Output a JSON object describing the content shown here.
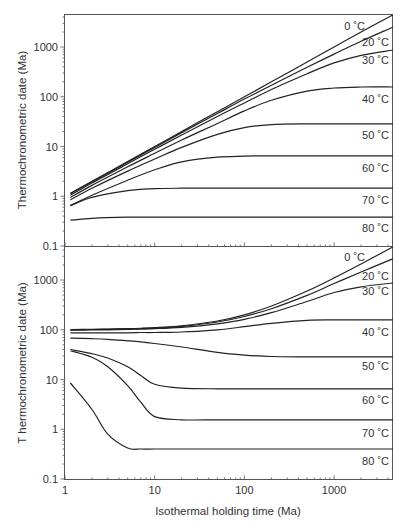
{
  "chart_data": [
    {
      "type": "line",
      "panel": "top",
      "title": "",
      "xlabel": "",
      "ylabel": "Thermochronometric date (Ma)",
      "xscale": "log",
      "yscale": "log",
      "xlim": [
        1,
        4500
      ],
      "ylim": [
        0.1,
        4600
      ],
      "yticks": [
        0.1,
        1,
        10,
        100,
        1000
      ],
      "ytick_labels": [
        "0.1",
        "1",
        "10",
        "100",
        "1000"
      ],
      "grid": false,
      "x": [
        1.15,
        2,
        5,
        10,
        20,
        50,
        100,
        200,
        500,
        1000,
        2000,
        4500
      ],
      "series": [
        {
          "name": "0 ˚C",
          "values": [
            1.15,
            2.0,
            5.0,
            10.0,
            20.0,
            50.0,
            100.0,
            200.0,
            500.0,
            1000.0,
            2000.0,
            4400.0
          ]
        },
        {
          "name": "20 ˚C",
          "values": [
            1.12,
            1.95,
            4.85,
            9.6,
            19.0,
            46.0,
            90.0,
            170.0,
            390.0,
            720.0,
            1300.0,
            2500.0
          ]
        },
        {
          "name": "30 ˚C",
          "values": [
            1.05,
            1.85,
            4.5,
            8.8,
            17.0,
            40.0,
            75.0,
            140.0,
            290.0,
            480.0,
            680.0,
            870.0
          ]
        },
        {
          "name": "40 ˚C",
          "values": [
            0.95,
            1.65,
            3.9,
            7.3,
            13.5,
            29.0,
            52.0,
            85.0,
            130.0,
            150.0,
            157.0,
            157.0
          ]
        },
        {
          "name": "50 ˚C",
          "values": [
            0.85,
            1.45,
            3.2,
            5.6,
            9.6,
            17.5,
            24.0,
            27.5,
            28.5,
            28.5,
            28.5,
            28.5
          ]
        },
        {
          "name": "60 ˚C",
          "values": [
            0.65,
            1.05,
            2.1,
            3.4,
            4.9,
            6.1,
            6.4,
            6.5,
            6.5,
            6.5,
            6.5,
            6.5
          ]
        },
        {
          "name": "70 ˚C",
          "values": [
            0.65,
            0.95,
            1.3,
            1.42,
            1.45,
            1.45,
            1.45,
            1.45,
            1.45,
            1.45,
            1.45,
            1.45
          ]
        },
        {
          "name": "80 ˚C",
          "values": [
            0.33,
            0.36,
            0.38,
            0.38,
            0.38,
            0.38,
            0.38,
            0.38,
            0.38,
            0.38,
            0.38,
            0.38
          ]
        }
      ]
    },
    {
      "type": "line",
      "panel": "bottom",
      "title": "",
      "xlabel": "Isothermal holding time (Ma)",
      "ylabel": "T hermochronometric date (Ma)",
      "xscale": "log",
      "yscale": "log",
      "xlim": [
        1,
        4500
      ],
      "ylim": [
        0.1,
        4600
      ],
      "xticks": [
        1,
        10,
        100,
        1000
      ],
      "xtick_labels": [
        "1",
        "10",
        "100",
        "1000"
      ],
      "yticks": [
        0.1,
        1,
        10,
        100,
        1000
      ],
      "ytick_labels": [
        "0.1",
        "1",
        "10",
        "100",
        "1000"
      ],
      "grid": false,
      "x": [
        1.15,
        2,
        3,
        5,
        7,
        10,
        20,
        50,
        100,
        200,
        500,
        1000,
        2000,
        4500
      ],
      "series": [
        {
          "name": "0 ˚C",
          "values": [
            101,
            102,
            103,
            105,
            107,
            110,
            120,
            150,
            200,
            300,
            600,
            1100,
            2100,
            4600
          ]
        },
        {
          "name": "20 ˚C",
          "values": [
            100,
            101,
            102,
            104,
            106,
            108,
            117,
            143,
            185,
            265,
            490,
            850,
            1450,
            2650
          ]
        },
        {
          "name": "30 ˚C",
          "values": [
            98,
            99,
            100,
            102,
            103,
            105,
            112,
            132,
            162,
            220,
            370,
            560,
            730,
            870
          ]
        },
        {
          "name": "40 ˚C",
          "values": [
            87,
            87,
            87,
            87,
            88,
            88,
            90,
            100,
            115,
            135,
            155,
            158,
            158,
            158
          ]
        },
        {
          "name": "50 ˚C",
          "values": [
            68,
            66,
            64,
            60,
            57,
            53,
            45,
            35,
            31,
            29,
            28.5,
            28.5,
            28.5,
            28.5
          ]
        },
        {
          "name": "60 ˚C",
          "values": [
            40,
            33,
            27,
            18,
            12,
            8,
            6.7,
            6.5,
            6.5,
            6.5,
            6.5,
            6.5,
            6.5,
            6.5
          ]
        },
        {
          "name": "70 ˚C",
          "values": [
            38,
            28,
            18,
            7.5,
            3.5,
            1.8,
            1.55,
            1.55,
            1.55,
            1.55,
            1.55,
            1.55,
            1.55,
            1.55
          ]
        },
        {
          "name": "80 ˚C",
          "values": [
            8.5,
            2.5,
            0.8,
            0.42,
            0.4,
            0.4,
            0.4,
            0.4,
            0.4,
            0.4,
            0.4,
            0.4,
            0.4,
            0.4
          ]
        }
      ]
    }
  ],
  "labels": {
    "top_ylabel": "Thermochronometric date (Ma)",
    "bottom_ylabel": "T hermochronometric date (Ma)",
    "xlabel": "Isothermal holding time (Ma)",
    "ytick_labels": [
      "0.1",
      "1",
      "10",
      "100",
      "1000"
    ],
    "xtick_labels": [
      "1",
      "10",
      "100",
      "1000"
    ],
    "series_labels": [
      "0 ˚C",
      "20 ˚C",
      "30 ˚C",
      "40 ˚C",
      "50 ˚C",
      "60 ˚C",
      "70 ˚C",
      "80 ˚C"
    ]
  },
  "colors": {
    "line": "#222222",
    "axis": "#555555",
    "text": "#333333",
    "background": "#ffffff"
  }
}
